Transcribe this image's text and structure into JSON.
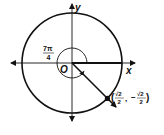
{
  "diagram": {
    "axes": {
      "x_label": "x",
      "y_label": "y",
      "origin_label": "O"
    },
    "angle": {
      "numerator": "7π",
      "denominator": "4"
    },
    "point": {
      "open_paren": "(",
      "x_num": "√2",
      "x_den": "2",
      "comma": ",",
      "y_sign": "−",
      "y_num": "√2",
      "y_den": "2",
      "close_paren": ")"
    },
    "colors": {
      "stroke": "#111111",
      "background": "#ffffff"
    }
  }
}
